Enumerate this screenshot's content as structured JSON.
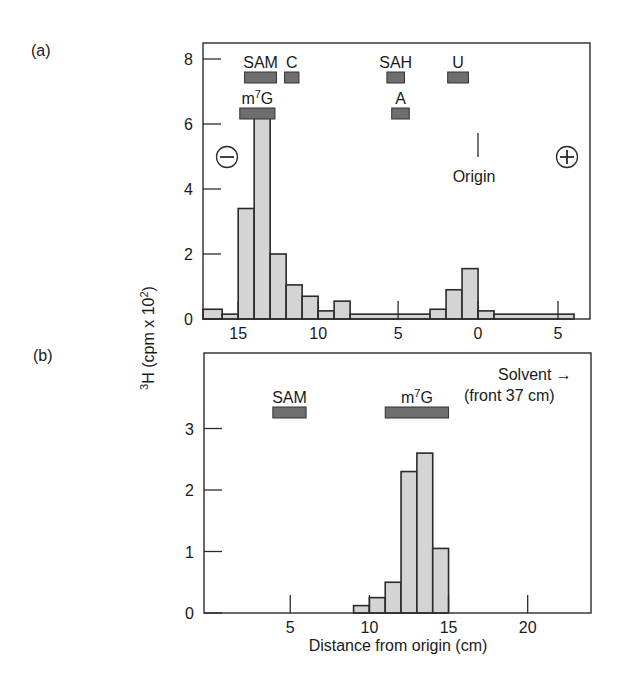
{
  "chart_data": [
    {
      "panel_label": "(a)",
      "type": "bar",
      "ylabel": "3H (cpm x 10^2)",
      "xlabel": "",
      "xlim": [
        17.2,
        -7.0
      ],
      "ylim": [
        0,
        8.8
      ],
      "xticks": [
        15,
        10,
        5,
        0,
        -5
      ],
      "xtick_labels": [
        "15",
        "10",
        "5",
        "0",
        "5"
      ],
      "yticks": [
        0,
        2,
        4,
        6,
        8
      ],
      "ytick_labels": [
        "0",
        "2",
        "4",
        "6",
        "8"
      ],
      "bins": [
        {
          "from": 17.2,
          "to": 16,
          "value": 0.3
        },
        {
          "from": 16,
          "to": 15,
          "value": 0.15
        },
        {
          "from": 15,
          "to": 14,
          "value": 3.4
        },
        {
          "from": 14,
          "to": 13,
          "value": 6.3
        },
        {
          "from": 13,
          "to": 12,
          "value": 2.0
        },
        {
          "from": 12,
          "to": 11,
          "value": 1.05
        },
        {
          "from": 11,
          "to": 10,
          "value": 0.7
        },
        {
          "from": 10,
          "to": 9,
          "value": 0.25
        },
        {
          "from": 9,
          "to": 8,
          "value": 0.55
        },
        {
          "from": 8,
          "to": 3,
          "value": 0.15
        },
        {
          "from": 3,
          "to": 2,
          "value": 0.3
        },
        {
          "from": 2,
          "to": 1,
          "value": 0.9
        },
        {
          "from": 1,
          "to": 0,
          "value": 1.55
        },
        {
          "from": 0,
          "to": -1,
          "value": 0.25
        },
        {
          "from": -1,
          "to": -6,
          "value": 0.15
        }
      ],
      "markers": [
        {
          "label": "SAM",
          "from": 14.6,
          "to": 12.6,
          "row": 1
        },
        {
          "label": "C",
          "from": 12.1,
          "to": 11.2,
          "row": 1
        },
        {
          "label": "SAH",
          "from": 5.7,
          "to": 4.6,
          "row": 1
        },
        {
          "label": "U",
          "from": 1.9,
          "to": 0.6,
          "row": 1
        },
        {
          "label": "m7G",
          "from": 14.9,
          "to": 12.7,
          "row": 2
        },
        {
          "label": "A",
          "from": 5.4,
          "to": 4.3,
          "row": 2
        }
      ],
      "annotations": [
        {
          "text": "Origin",
          "x": 0
        },
        {
          "text": "−",
          "meaning": "cathode"
        },
        {
          "text": "+",
          "meaning": "anode"
        }
      ]
    },
    {
      "panel_label": "(b)",
      "type": "bar",
      "ylabel": "3H (cpm x 10^2)",
      "xlabel": "Distance from origin (cm)",
      "xlim": [
        -0.45,
        24
      ],
      "ylim": [
        0,
        3.9
      ],
      "xticks": [
        5,
        10,
        15,
        20
      ],
      "xtick_labels": [
        "5",
        "10",
        "15",
        "20"
      ],
      "yticks": [
        0,
        1,
        2,
        3
      ],
      "ytick_labels": [
        "0",
        "1",
        "2",
        "3"
      ],
      "bins": [
        {
          "from": 9,
          "to": 10,
          "value": 0.12
        },
        {
          "from": 10,
          "to": 11,
          "value": 0.25
        },
        {
          "from": 11,
          "to": 12,
          "value": 0.5
        },
        {
          "from": 12,
          "to": 13,
          "value": 2.3
        },
        {
          "from": 13,
          "to": 14,
          "value": 2.6
        },
        {
          "from": 14,
          "to": 15,
          "value": 1.05
        }
      ],
      "markers": [
        {
          "label": "SAM",
          "from": 3.9,
          "to": 6.0,
          "row": 1
        },
        {
          "label": "m7G",
          "from": 11.0,
          "to": 15.0,
          "row": 1
        }
      ],
      "annotations": [
        {
          "text": "Solvent →",
          "line2": "(front 37 cm)"
        }
      ]
    }
  ],
  "labels": {
    "panel_a": "(a)",
    "panel_b": "(b)",
    "ylabel_sup": "3",
    "ylabel_main": "H (cpm x 10",
    "ylabel_exp": "2",
    "ylabel_close": ")",
    "xlabel_b": "Distance from origin (cm)",
    "origin": "Origin",
    "minus": "−",
    "plus": "+",
    "solvent": "Solvent →",
    "front": "(front 37 cm)"
  }
}
